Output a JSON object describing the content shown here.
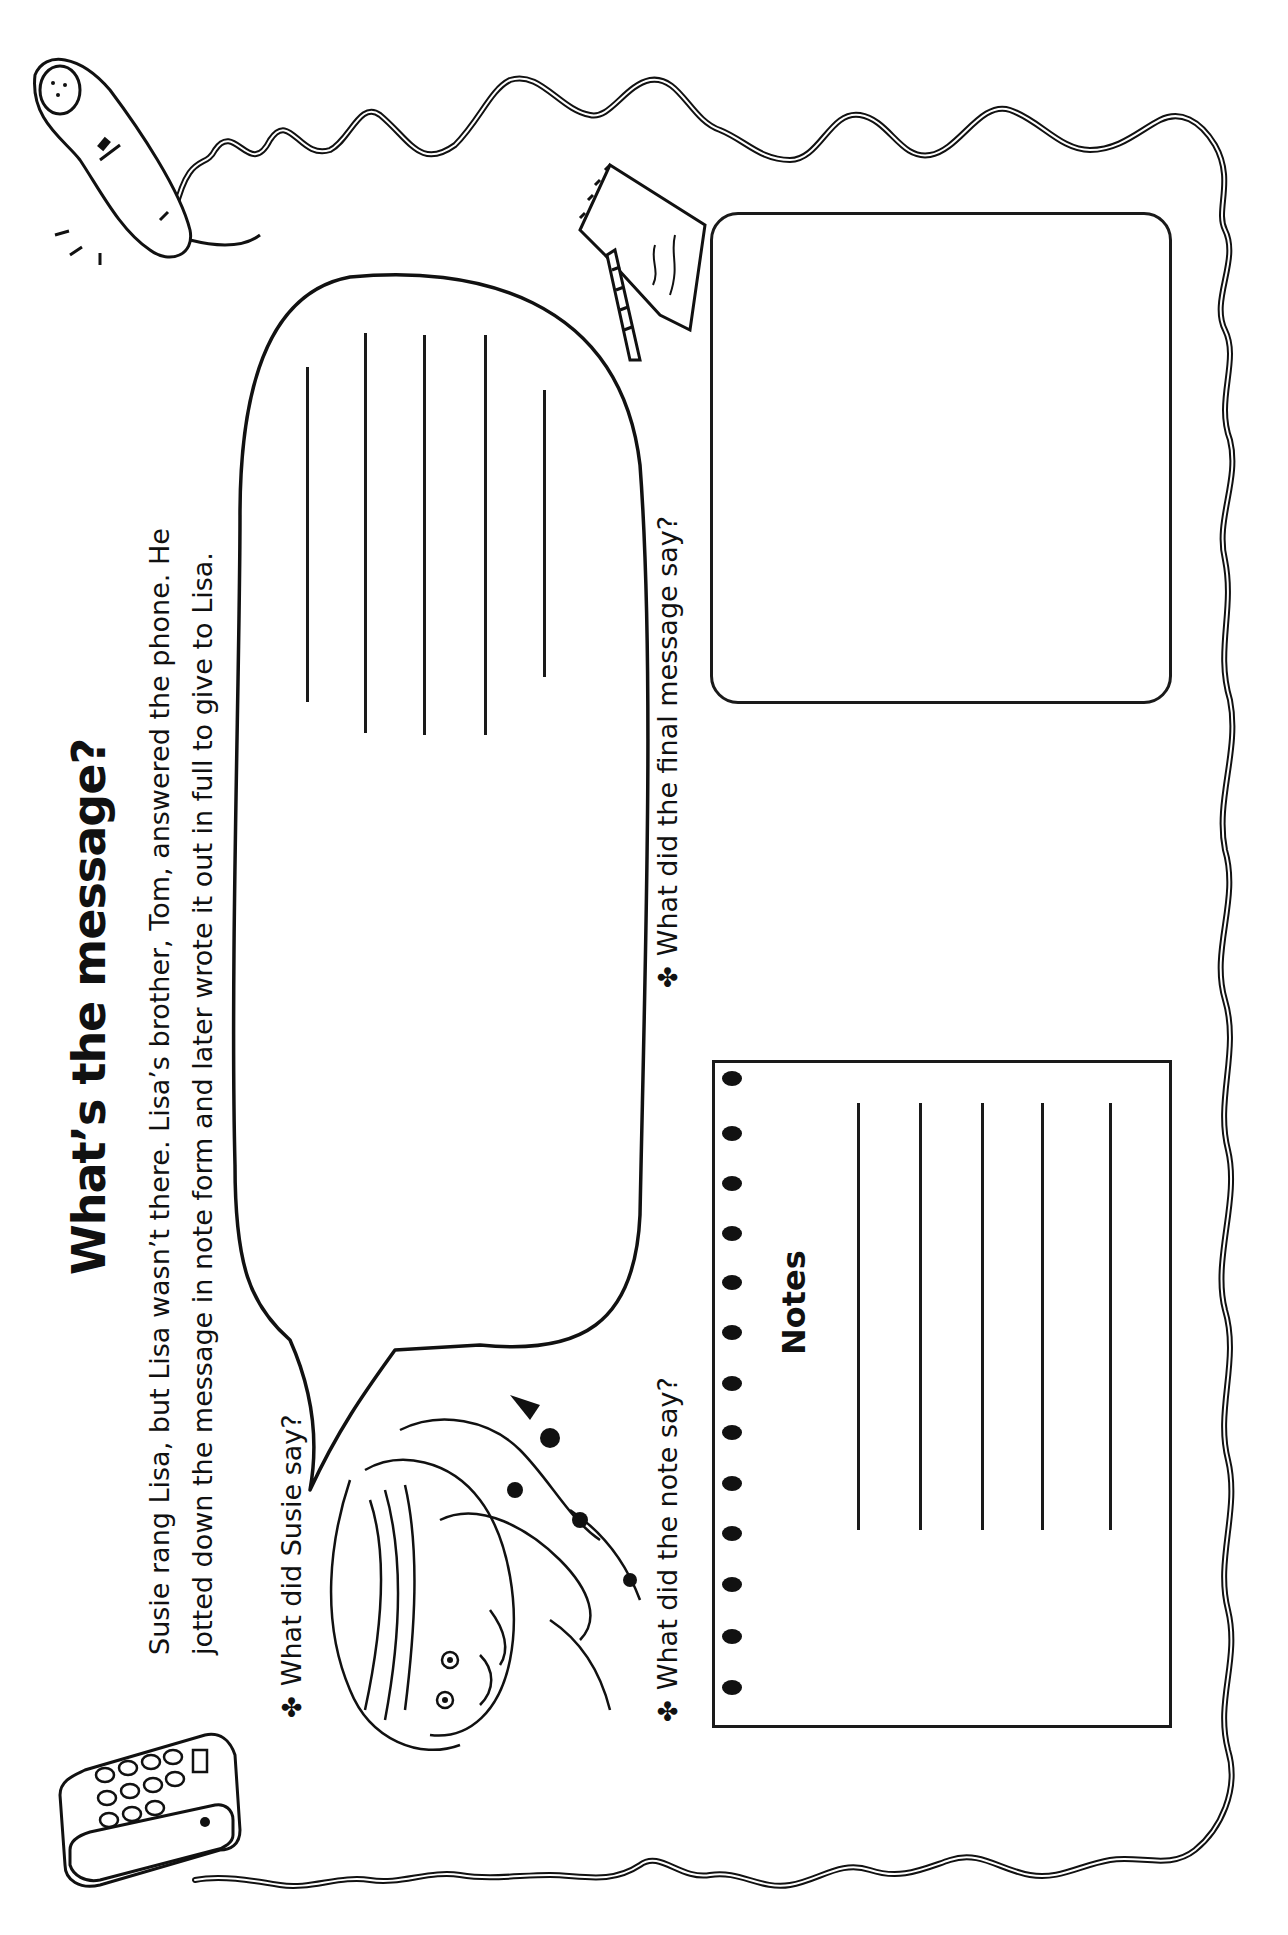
{
  "worksheet": {
    "title": "What’s the message?",
    "intro_lines": [
      "Susie rang Lisa, but Lisa wasn’t there. Lisa’s brother, Tom, answered the phone. He",
      "jotted down the message in note form and later wrote it out in full to give to Lisa."
    ],
    "prompts": [
      {
        "bullet": "✤",
        "text": "What did Susie say?"
      },
      {
        "bullet": "✤",
        "text": "What did the note say?"
      },
      {
        "bullet": "✤",
        "text": "What did the final message say?"
      }
    ],
    "notes_box": {
      "label": "Notes",
      "ring_count": 13,
      "writing_line_count": 5
    },
    "speech_bubble": {
      "writing_line_count": 5
    },
    "final_message_box": {
      "writing_line_count": 0
    },
    "orientation": "rotated 90° counter-clockwise",
    "illustrations": [
      "telephone-handset",
      "desk-telephone",
      "notepad-with-pencil",
      "girl-on-phone",
      "curly-phone-cord-border"
    ]
  }
}
